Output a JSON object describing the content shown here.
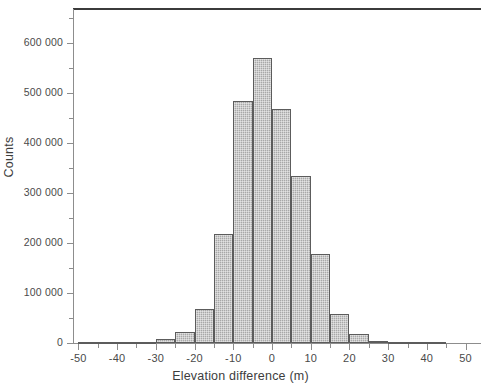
{
  "chart_data": {
    "type": "bar",
    "title": "",
    "subtitle": "",
    "xlabel": "Elevation difference (m)",
    "ylabel": "Counts",
    "xlim": [
      -52,
      56
    ],
    "ylim": [
      0,
      660000
    ],
    "bin_width": 5,
    "grid": false,
    "legend": null,
    "x_tick_labels": [
      "-50",
      "-40",
      "-30",
      "-20",
      "-10",
      "0",
      "10",
      "20",
      "30",
      "40",
      "50"
    ],
    "x_tick_values": [
      -50,
      -40,
      -30,
      -20,
      -10,
      0,
      10,
      20,
      30,
      40,
      50
    ],
    "x_minor_tick_values": [
      -45,
      -35,
      -25,
      -15,
      -5,
      5,
      15,
      25,
      35,
      45,
      55
    ],
    "y_tick_labels": [
      "0",
      "100 000",
      "200 000",
      "300 000",
      "400 000",
      "500 000",
      "600 000"
    ],
    "y_tick_values": [
      0,
      100000,
      200000,
      300000,
      400000,
      500000,
      600000
    ],
    "y_minor_tick_values": [
      50000,
      150000,
      250000,
      350000,
      450000,
      550000,
      650000
    ],
    "bar_fill_color": "#a8a8a8",
    "bar_edge_color": "#5c5c5c",
    "bin_left_edges": [
      -50,
      -45,
      -40,
      -35,
      -30,
      -25,
      -20,
      -15,
      -10,
      -5,
      0,
      5,
      10,
      15,
      20,
      25,
      30,
      35,
      40
    ],
    "categories": [
      "-50",
      "-45",
      "-40",
      "-35",
      "-30",
      "-25",
      "-20",
      "-15",
      "-10",
      "-5",
      "0",
      "5",
      "10",
      "15",
      "20",
      "25",
      "30",
      "35",
      "40"
    ],
    "values": [
      300,
      600,
      1200,
      2200,
      8000,
      22000,
      68000,
      219000,
      485000,
      570000,
      468000,
      334000,
      178000,
      58000,
      18000,
      5000,
      3000,
      1800,
      800
    ]
  }
}
